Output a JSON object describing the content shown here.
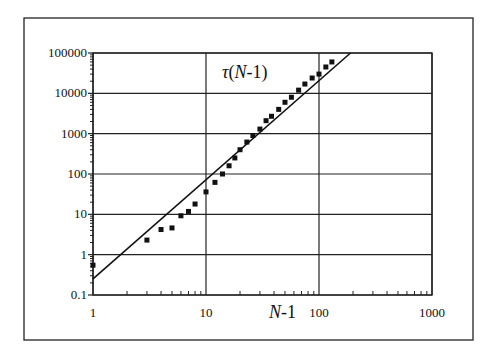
{
  "chart_data": {
    "type": "scatter",
    "title": "τ(N-1)",
    "title_parts": {
      "symbol": "τ",
      "open": "(",
      "var": "N",
      "rest": "-1)"
    },
    "xlabel": "N-1",
    "xlabel_parts": {
      "var": "N",
      "rest": "-1"
    },
    "ylabel": "",
    "xscale": "log",
    "yscale": "log",
    "xlim": [
      1,
      1000
    ],
    "ylim": [
      0.1,
      100000
    ],
    "x_ticks": [
      "1",
      "10",
      "100",
      "1000"
    ],
    "y_ticks": [
      "0.1",
      "1",
      "10",
      "100",
      "1000",
      "10000",
      "100000"
    ],
    "grid": "major gridlines on both axes",
    "legend": "none",
    "series": [
      {
        "name": "τ(N-1) data",
        "marker": "square",
        "x": [
          1,
          3,
          4,
          5,
          6,
          7,
          8,
          10,
          12,
          14,
          16,
          18,
          20,
          23,
          26,
          30,
          34,
          38,
          44,
          50,
          57,
          66,
          75,
          87,
          100,
          115,
          130
        ],
        "y": [
          0.55,
          2.3,
          4.2,
          4.6,
          9.2,
          11.8,
          18,
          36,
          62,
          100,
          160,
          250,
          400,
          620,
          900,
          1300,
          2100,
          2700,
          4000,
          6000,
          8000,
          12000,
          17000,
          24000,
          30000,
          45000,
          60000
        ]
      },
      {
        "name": "power-law fit",
        "line": "solid",
        "x": [
          1,
          190
        ],
        "y": [
          0.25,
          100000
        ]
      }
    ]
  }
}
